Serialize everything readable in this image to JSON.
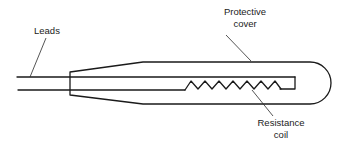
{
  "diagram": {
    "colors": {
      "line": "#1a1a1a",
      "text": "#222222",
      "background": "#ffffff"
    },
    "labels": {
      "leads": "Leads",
      "protective_cover_line1": "Protective",
      "protective_cover_line2": "cover",
      "resistance_coil_line1": "Resistance",
      "resistance_coil_line2": "coil"
    },
    "components": [
      "leads",
      "protective-cover",
      "resistance-coil"
    ]
  }
}
